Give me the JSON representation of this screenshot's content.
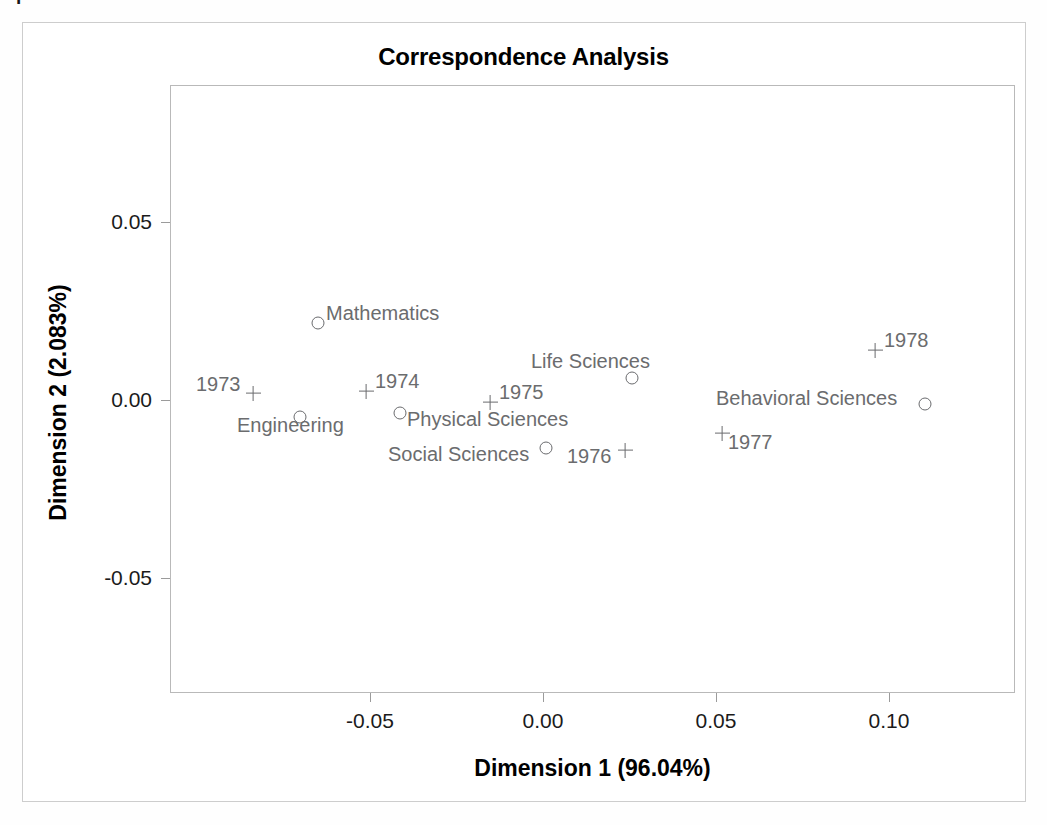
{
  "page": {
    "scan_artifact_text": "p",
    "background_color": "#ffffff"
  },
  "chart": {
    "title": "Correspondence Analysis",
    "xlabel": "Dimension 1 (96.04%)",
    "ylabel": "Dimension 2 (2.083%)",
    "marker_color": "#6a6b6e",
    "label_color": "#6b6c6e",
    "axis_color": "#b9b9b9"
  },
  "chart_data": {
    "type": "scatter",
    "title": "Correspondence Analysis",
    "xlabel": "Dimension 1 (96.04%)",
    "ylabel": "Dimension 2 (2.083%)",
    "xlim": [
      -0.0855,
      0.1345
    ],
    "ylim": [
      -0.0745,
      0.0635
    ],
    "xticks": [
      "-0.05",
      "0.00",
      "0.05",
      "0.10"
    ],
    "xtick_values": [
      -0.05,
      0.0,
      0.05,
      0.1
    ],
    "yticks": [
      "0.05",
      "0.00",
      "-0.05"
    ],
    "ytick_values": [
      0.05,
      0.0,
      -0.05
    ],
    "grid": false,
    "legend": null,
    "dimension_1_inertia_pct": 96.04,
    "dimension_2_inertia_pct": 2.083,
    "series": [
      {
        "name": "Field of study (row points)",
        "marker": "circle",
        "points": [
          {
            "label": "Mathematics",
            "x": -0.065,
            "y": 0.022,
            "px": 318,
            "py": 323,
            "label_side": "right",
            "label_dx": 8,
            "label_dy": -10
          },
          {
            "label": "Engineering",
            "x": -0.07,
            "y": -0.005,
            "px": 300,
            "py": 417,
            "label_side": "below",
            "label_dx": -63,
            "label_dy": 8
          },
          {
            "label": "Physical Sciences",
            "x": -0.041,
            "y": -0.004,
            "px": 400,
            "py": 413,
            "label_side": "right",
            "label_dx": 7,
            "label_dy": 6
          },
          {
            "label": "Social Sciences",
            "x": 0.001,
            "y": -0.013,
            "px": 546,
            "py": 448,
            "label_side": "left",
            "label_dx": -158,
            "label_dy": 6
          },
          {
            "label": "Life Sciences",
            "x": 0.026,
            "y": 0.006,
            "px": 632,
            "py": 378,
            "label_side": "above",
            "label_dx": -101,
            "label_dy": -17
          },
          {
            "label": "Behavioral Sciences",
            "x": 0.11,
            "y": -0.001,
            "px": 925,
            "py": 404,
            "label_side": "left",
            "label_dx": -209,
            "label_dy": -6
          }
        ]
      },
      {
        "name": "Year (column points)",
        "marker": "plus",
        "points": [
          {
            "label": "1973",
            "x": -0.084,
            "y": 0.002,
            "px": 253,
            "py": 393,
            "label_side": "left",
            "label_dx": -57,
            "label_dy": -9
          },
          {
            "label": "1974",
            "x": -0.051,
            "y": 0.003,
            "px": 366,
            "py": 391,
            "label_side": "right",
            "label_dx": 9,
            "label_dy": -10
          },
          {
            "label": "1975",
            "x": -0.015,
            "y": -0.001,
            "px": 490,
            "py": 402,
            "label_side": "right",
            "label_dx": 9,
            "label_dy": -10
          },
          {
            "label": "1976",
            "x": 0.024,
            "y": -0.014,
            "px": 625,
            "py": 450,
            "label_side": "left",
            "label_dx": -58,
            "label_dy": 6
          },
          {
            "label": "1977",
            "x": 0.052,
            "y": -0.009,
            "px": 722,
            "py": 433,
            "label_side": "right",
            "label_dx": 6,
            "label_dy": 9
          },
          {
            "label": "1978",
            "x": 0.096,
            "y": 0.014,
            "px": 875,
            "py": 350,
            "label_side": "right",
            "label_dx": 9,
            "label_dy": -10
          }
        ]
      }
    ]
  }
}
